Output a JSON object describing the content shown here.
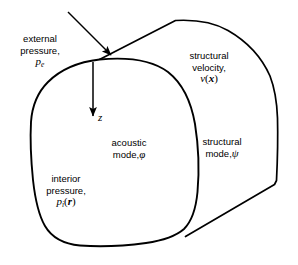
{
  "figure": {
    "type": "technical-diagram",
    "stroke_color": "#000000",
    "fill_color": "#ffffff",
    "background_color": "#ffffff"
  },
  "labels": {
    "external_pressure": {
      "line1": "external",
      "line2": "pressure,",
      "symbol": "p",
      "subscript": "e"
    },
    "structural_velocity": {
      "line1": "structural",
      "line2": "velocity,",
      "symbol": "v",
      "open_paren": "(",
      "argument": "x",
      "close_paren": ")"
    },
    "acoustic_mode": {
      "line1": "acoustic",
      "line2": "mode,",
      "symbol": "φ"
    },
    "structural_mode": {
      "line1": "structural",
      "line2": "mode,",
      "symbol": "ψ"
    },
    "interior_pressure": {
      "line1": "interior",
      "line2": "pressure,",
      "symbol": "p",
      "subscript": "i",
      "open_paren": "(",
      "argument": "r",
      "close_paren": ")"
    },
    "z_axis": {
      "symbol": "z"
    }
  },
  "arrows": {
    "external_pressure_arrow": {
      "name": "external-pressure-arrow",
      "from_x": 68,
      "from_y": 12,
      "to_x": 113,
      "to_y": 57
    },
    "z_axis_arrow": {
      "name": "z-axis-arrow",
      "from_x": 93,
      "from_y": 63,
      "to_x": 93,
      "to_y": 118
    }
  },
  "geometry": {
    "front_face_name": "front-face-blob",
    "top_edge_name": "top-edge",
    "right_edge_name": "right-back-edge",
    "bottom_edge_name": "bottom-diagonal-edge"
  }
}
